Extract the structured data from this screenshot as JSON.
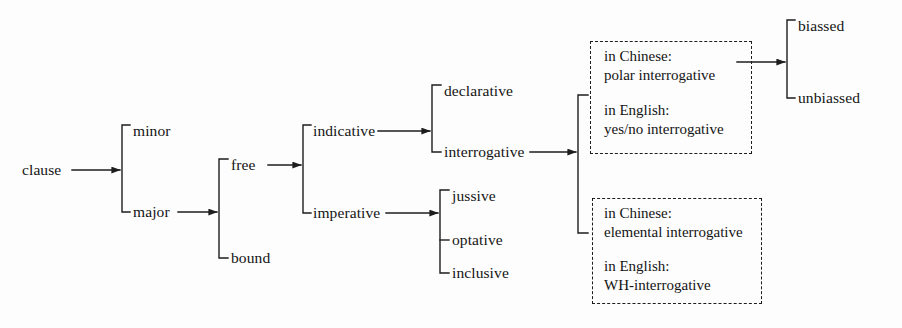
{
  "diagram": {
    "type": "system-network-tree",
    "title_visible": false,
    "background_color": "#fdfdfd",
    "line_color": "#1d1d1d",
    "text_color": "#141414",
    "root": {
      "label": "clause",
      "x": 22,
      "y": 170
    },
    "nodes": [
      {
        "id": "minor",
        "label": "minor",
        "x": 133,
        "y": 131
      },
      {
        "id": "major",
        "label": "major",
        "x": 133,
        "y": 212
      },
      {
        "id": "free",
        "label": "free",
        "x": 231,
        "y": 165
      },
      {
        "id": "bound",
        "label": "bound",
        "x": 231,
        "y": 258
      },
      {
        "id": "indicative",
        "label": "indicative",
        "x": 313,
        "y": 131
      },
      {
        "id": "imperative",
        "label": "imperative",
        "x": 313,
        "y": 213
      },
      {
        "id": "declarative",
        "label": "declarative",
        "x": 444,
        "y": 91
      },
      {
        "id": "interrogative",
        "label": "interrogative",
        "x": 444,
        "y": 152
      },
      {
        "id": "jussive",
        "label": "jussive",
        "x": 452,
        "y": 196
      },
      {
        "id": "optative",
        "label": "optative",
        "x": 452,
        "y": 240
      },
      {
        "id": "inclusive",
        "label": "inclusive",
        "x": 452,
        "y": 273
      },
      {
        "id": "biassed",
        "label": "biassed",
        "x": 798,
        "y": 26
      },
      {
        "id": "unbiassed",
        "label": "unbiassed",
        "x": 798,
        "y": 98
      }
    ],
    "boxes": [
      {
        "id": "polar-interrogative-box",
        "x": 590,
        "y": 41,
        "width": 162,
        "height": 113,
        "lines": [
          "in Chinese:",
          "polar interrogative",
          "",
          "in English:",
          "yes/no interrogative"
        ],
        "groups": [
          {
            "language_label": "in Chinese:",
            "term": "polar interrogative"
          },
          {
            "language_label": "in English:",
            "term": "yes/no interrogative"
          }
        ]
      },
      {
        "id": "elemental-interrogative-box",
        "x": 592,
        "y": 198,
        "width": 170,
        "height": 106,
        "lines": [
          "in Chinese:",
          "elemental interrogative",
          "",
          "in English:",
          "WH-interrogative"
        ],
        "groups": [
          {
            "language_label": "in Chinese:",
            "term": "elemental interrogative"
          },
          {
            "language_label": "in English:",
            "term": "WH-interrogative"
          }
        ]
      }
    ],
    "systems": [
      {
        "entry": "clause",
        "terms": [
          "minor",
          "major"
        ]
      },
      {
        "entry": "major",
        "terms": [
          "free",
          "bound"
        ]
      },
      {
        "entry": "free",
        "terms": [
          "indicative",
          "imperative"
        ]
      },
      {
        "entry": "indicative",
        "terms": [
          "declarative",
          "interrogative"
        ]
      },
      {
        "entry": "imperative",
        "terms": [
          "jussive",
          "optative",
          "inclusive"
        ]
      },
      {
        "entry": "interrogative",
        "terms": [
          "polar-interrogative-box",
          "elemental-interrogative-box"
        ]
      },
      {
        "entry": "polar-interrogative-box",
        "terms": [
          "biassed",
          "unbiassed"
        ]
      }
    ]
  }
}
